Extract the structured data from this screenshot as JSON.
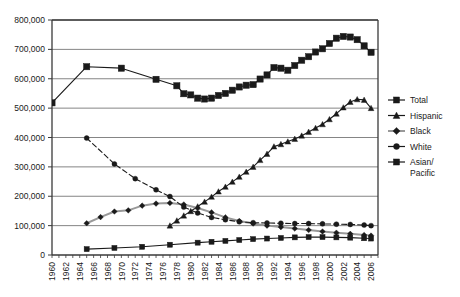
{
  "chart_data": {
    "type": "line",
    "title": "",
    "subtitle": "",
    "xlabel": "",
    "ylabel": "",
    "xlim": [
      1960,
      2007
    ],
    "ylim": [
      0,
      800000
    ],
    "grid": true,
    "grid_axis": "y",
    "legend_position": "right",
    "ytick_labels": [
      "800,000",
      "700,000",
      "600,000",
      "500,000",
      "400,000",
      "300,000",
      "200,000",
      "100,000",
      "0"
    ],
    "ytick_values": [
      800000,
      700000,
      600000,
      500000,
      400000,
      300000,
      200000,
      100000,
      0
    ],
    "xtick_labels": [
      "1960",
      "1962",
      "1964",
      "1966",
      "1968",
      "1970",
      "1972",
      "1974",
      "1976",
      "1978",
      "1980",
      "1982",
      "1984",
      "1986",
      "1988",
      "1990",
      "1992",
      "1994",
      "1996",
      "1998",
      "2000",
      "2002",
      "2004",
      "2006"
    ],
    "xtick_values": [
      1960,
      1962,
      1964,
      1966,
      1968,
      1970,
      1972,
      1974,
      1976,
      1978,
      1980,
      1982,
      1984,
      1986,
      1988,
      1990,
      1992,
      1994,
      1996,
      1998,
      2000,
      2002,
      2004,
      2006
    ],
    "series": [
      {
        "name": "Total",
        "marker": "square",
        "color": "#1a1a1a",
        "line_style": "solid",
        "x": [
          1960,
          1965,
          1970,
          1975,
          1978,
          1979,
          1980,
          1981,
          1982,
          1983,
          1984,
          1985,
          1986,
          1987,
          1988,
          1989,
          1990,
          1991,
          1992,
          1993,
          1994,
          1995,
          1996,
          1997,
          1998,
          1999,
          2000,
          2001,
          2002,
          2003,
          2004,
          2005,
          2006
        ],
        "values": [
          518000,
          641000,
          636000,
          598000,
          576000,
          549000,
          545000,
          534000,
          531000,
          534000,
          543000,
          550000,
          561000,
          572000,
          578000,
          580000,
          599000,
          613000,
          638000,
          636000,
          629000,
          645000,
          663000,
          675000,
          691000,
          702000,
          720000,
          738000,
          744000,
          742000,
          733000,
          712000,
          690000
        ]
      },
      {
        "name": "Hispanic",
        "marker": "triangle",
        "color": "#1a1a1a",
        "line_style": "solid",
        "x": [
          1977,
          1978,
          1979,
          1980,
          1981,
          1982,
          1983,
          1984,
          1985,
          1986,
          1987,
          1988,
          1989,
          1990,
          1991,
          1992,
          1993,
          1994,
          1995,
          1996,
          1997,
          1998,
          1999,
          2000,
          2001,
          2002,
          2003,
          2004,
          2005,
          2006
        ],
        "values": [
          100000,
          117000,
          134000,
          149000,
          165000,
          181000,
          198000,
          216000,
          232000,
          249000,
          266000,
          283000,
          300000,
          323000,
          344000,
          369000,
          377000,
          386000,
          395000,
          406000,
          419000,
          432000,
          445000,
          462000,
          481000,
          502000,
          521000,
          530000,
          528000,
          500000
        ]
      },
      {
        "name": "Black",
        "marker": "diamond",
        "color": "#999999",
        "line_style": "solid",
        "x": [
          1965,
          1967,
          1969,
          1971,
          1973,
          1975,
          1977,
          1979,
          1981,
          1983,
          1985,
          1987,
          1989,
          1991,
          1993,
          1995,
          1997,
          1999,
          2001,
          2003,
          2005,
          2006
        ],
        "values": [
          108000,
          129000,
          148000,
          152000,
          168000,
          175000,
          177000,
          172000,
          160000,
          145000,
          128000,
          116000,
          107000,
          100000,
          95000,
          90000,
          85000,
          80000,
          76000,
          72000,
          68000,
          66000
        ]
      },
      {
        "name": "White",
        "marker": "circle",
        "color": "#1a1a1a",
        "line_style": "dashed",
        "x": [
          1965,
          1969,
          1972,
          1975,
          1977,
          1979,
          1981,
          1983,
          1985,
          1987,
          1989,
          1991,
          1993,
          1995,
          1997,
          1999,
          2001,
          2003,
          2005,
          2006
        ],
        "values": [
          398000,
          310000,
          260000,
          222000,
          199000,
          163000,
          143000,
          128000,
          120000,
          113000,
          110000,
          109000,
          108000,
          107000,
          107000,
          106000,
          105000,
          104000,
          102000,
          100000
        ]
      },
      {
        "name": "Asian/Pacific",
        "marker": "square",
        "color": "#1a1a1a",
        "line_style": "solid",
        "x": [
          1965,
          1969,
          1973,
          1977,
          1981,
          1983,
          1985,
          1987,
          1989,
          1991,
          1993,
          1995,
          1997,
          1999,
          2001,
          2003,
          2005,
          2006
        ],
        "values": [
          20000,
          24000,
          28000,
          35000,
          42000,
          45000,
          48000,
          51000,
          54000,
          56000,
          58000,
          60000,
          61000,
          61000,
          60000,
          59000,
          57000,
          56000
        ]
      }
    ]
  },
  "legend": {
    "items": [
      {
        "label": "Total",
        "marker": "square"
      },
      {
        "label": "Hispanic",
        "marker": "triangle"
      },
      {
        "label": "Black",
        "marker": "diamond"
      },
      {
        "label": "White",
        "marker": "circle"
      },
      {
        "label": "Asian/",
        "label2": "Pacific",
        "marker": "square"
      }
    ]
  },
  "colors": {
    "axis": "#3a3a3a",
    "grid": "#777777",
    "series_dark": "#1a1a1a",
    "series_gray": "#999999",
    "background": "#ffffff"
  }
}
